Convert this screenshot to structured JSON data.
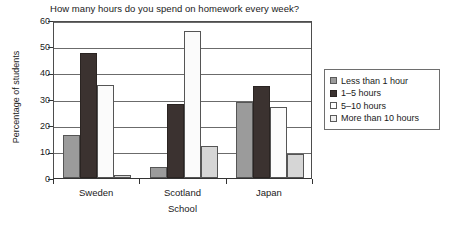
{
  "chart_data": {
    "type": "bar",
    "title": "How many hours do you spend on homework every week?",
    "xlabel": "School",
    "ylabel": "Percentage of students",
    "categories": [
      "Sweden",
      "Scotland",
      "Japan"
    ],
    "series": [
      {
        "name": "Less than 1 hour",
        "color": "#9b9b9b",
        "values": [
          16.5,
          4,
          29
        ]
      },
      {
        "name": "1–5 hours",
        "color": "#3b3230",
        "values": [
          47.5,
          28,
          35
        ]
      },
      {
        "name": "5–10 hours",
        "color": "#fbfbfb",
        "values": [
          35.5,
          56,
          26.8
        ]
      },
      {
        "name": "More than 10 hours",
        "color": "#d6d6d6",
        "values": [
          1,
          12,
          9
        ]
      }
    ],
    "ylim": [
      0,
      60
    ],
    "yticks": [
      0,
      10,
      20,
      30,
      40,
      50,
      60
    ],
    "ytick_labels": [
      "0",
      "10",
      "20",
      "30",
      "40",
      "50",
      "60"
    ],
    "grid": true,
    "legend_position": "right"
  },
  "legend": {
    "items": [
      {
        "label": "Less than 1 hour"
      },
      {
        "label": "1–5 hours"
      },
      {
        "label": "5–10 hours"
      },
      {
        "label": "More than 10 hours"
      }
    ]
  }
}
